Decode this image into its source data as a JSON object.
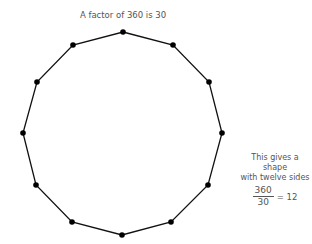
{
  "title": "A factor of 360 is 30",
  "note": {
    "line1": "This gives a shape",
    "line2": "with twelve sides",
    "fraction": {
      "numerator": "360",
      "denominator": "30"
    },
    "result": "= 12"
  },
  "polygon": {
    "sides": 12,
    "stroke_color": "#111111",
    "vertex_color": "#000000",
    "vertices": [
      [
        123,
        32
      ],
      [
        173,
        45
      ],
      [
        209,
        82
      ],
      [
        222,
        133
      ],
      [
        208,
        185
      ],
      [
        171,
        222
      ],
      [
        122,
        235
      ],
      [
        72,
        222
      ],
      [
        36,
        185
      ],
      [
        23,
        133
      ],
      [
        37,
        82
      ],
      [
        73,
        45
      ]
    ]
  }
}
